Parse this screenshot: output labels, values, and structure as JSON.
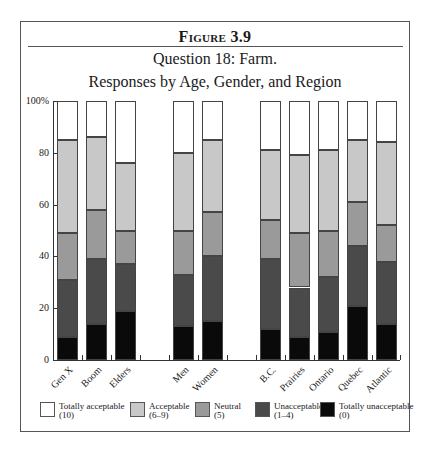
{
  "figure": {
    "label": "Figure 3.9",
    "title_line1": "Question 18: Farm.",
    "title_line2": "Responses by Age, Gender, and Region"
  },
  "chart_data": {
    "type": "bar",
    "stacked": true,
    "xlabel": "",
    "ylabel": "",
    "ylim": [
      0,
      100
    ],
    "y_ticks": [
      "0",
      "20",
      "40",
      "60",
      "80",
      "100%"
    ],
    "grid": false,
    "legend_position": "bottom",
    "groups": [
      {
        "name": "Age",
        "categories": [
          "Gen X",
          "Boom",
          "Elders"
        ]
      },
      {
        "name": "Gender",
        "categories": [
          "Men",
          "Women"
        ]
      },
      {
        "name": "Region",
        "categories": [
          "B.C.",
          "Prairies",
          "Ontario",
          "Quebec",
          "Atlantic"
        ]
      }
    ],
    "categories": [
      "Gen X",
      "Boom",
      "Elders",
      "Men",
      "Women",
      "B.C.",
      "Prairies",
      "Ontario",
      "Quebec",
      "Atlantic"
    ],
    "series": [
      {
        "name": "Totally unacceptable (0)",
        "color": "#0a0a0a",
        "values": [
          9,
          14,
          19,
          13,
          15,
          12,
          9,
          11,
          21,
          14
        ]
      },
      {
        "name": "Unacceptable (1-4)",
        "color": "#4a4a4a",
        "values": [
          22,
          25,
          18,
          20,
          25,
          27,
          19,
          21,
          23,
          24
        ]
      },
      {
        "name": "Neutral (5)",
        "color": "#9a9a9a",
        "values": [
          18,
          19,
          13,
          17,
          17,
          15,
          21,
          18,
          17,
          14
        ]
      },
      {
        "name": "Acceptable (6-9)",
        "color": "#c8c8c8",
        "values": [
          36,
          28,
          26,
          30,
          28,
          27,
          30,
          31,
          24,
          32
        ]
      },
      {
        "name": "Totally acceptable (10)",
        "color": "#ffffff",
        "values": [
          15,
          14,
          24,
          20,
          15,
          19,
          21,
          19,
          15,
          16
        ]
      }
    ]
  },
  "legend": [
    {
      "line1": "Totally acceptable",
      "line2": "(10)",
      "color": "#ffffff"
    },
    {
      "line1": "Acceptable",
      "line2": "(6–9)",
      "color": "#c8c8c8"
    },
    {
      "line1": "Neutral",
      "line2": "(5)",
      "color": "#9a9a9a"
    },
    {
      "line1": "Unacceptable",
      "line2": "(1–4)",
      "color": "#4a4a4a"
    },
    {
      "line1": "Totally unacceptable",
      "line2": "(0)",
      "color": "#0a0a0a"
    }
  ]
}
